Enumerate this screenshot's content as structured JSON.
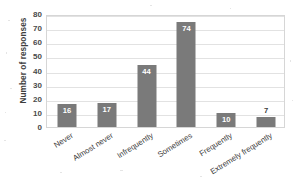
{
  "chart_data": {
    "type": "bar",
    "title": "",
    "xlabel": "",
    "ylabel": "Number of responses",
    "categories": [
      "Never",
      "Almost never",
      "Infrequently",
      "Sometimes",
      "Frequently",
      "Extremely frequently"
    ],
    "values": [
      16,
      17,
      44,
      74,
      10,
      7
    ],
    "data_labels": [
      "16",
      "17",
      "44",
      "74",
      "10",
      "7"
    ],
    "ylim": [
      0,
      80
    ],
    "y_ticks": [
      0,
      10,
      20,
      30,
      40,
      50,
      60,
      70,
      80
    ],
    "y_tick_labels": [
      "0",
      "10",
      "20",
      "30",
      "40",
      "50",
      "60",
      "70",
      "80"
    ],
    "grid": true,
    "legend": false,
    "legend_position": "none",
    "series": [
      {
        "name": "Number of responses",
        "values": [
          16,
          17,
          44,
          74,
          10,
          7
        ],
        "color": "#7a7a7a"
      }
    ]
  },
  "colors": {
    "bar": "#7a7a7a",
    "gridline": "#e2e2e2",
    "plot_border": "#d6d6d6",
    "background": "#ffffff",
    "text": "#3d3d3d",
    "label_inside": "#ffffff"
  }
}
